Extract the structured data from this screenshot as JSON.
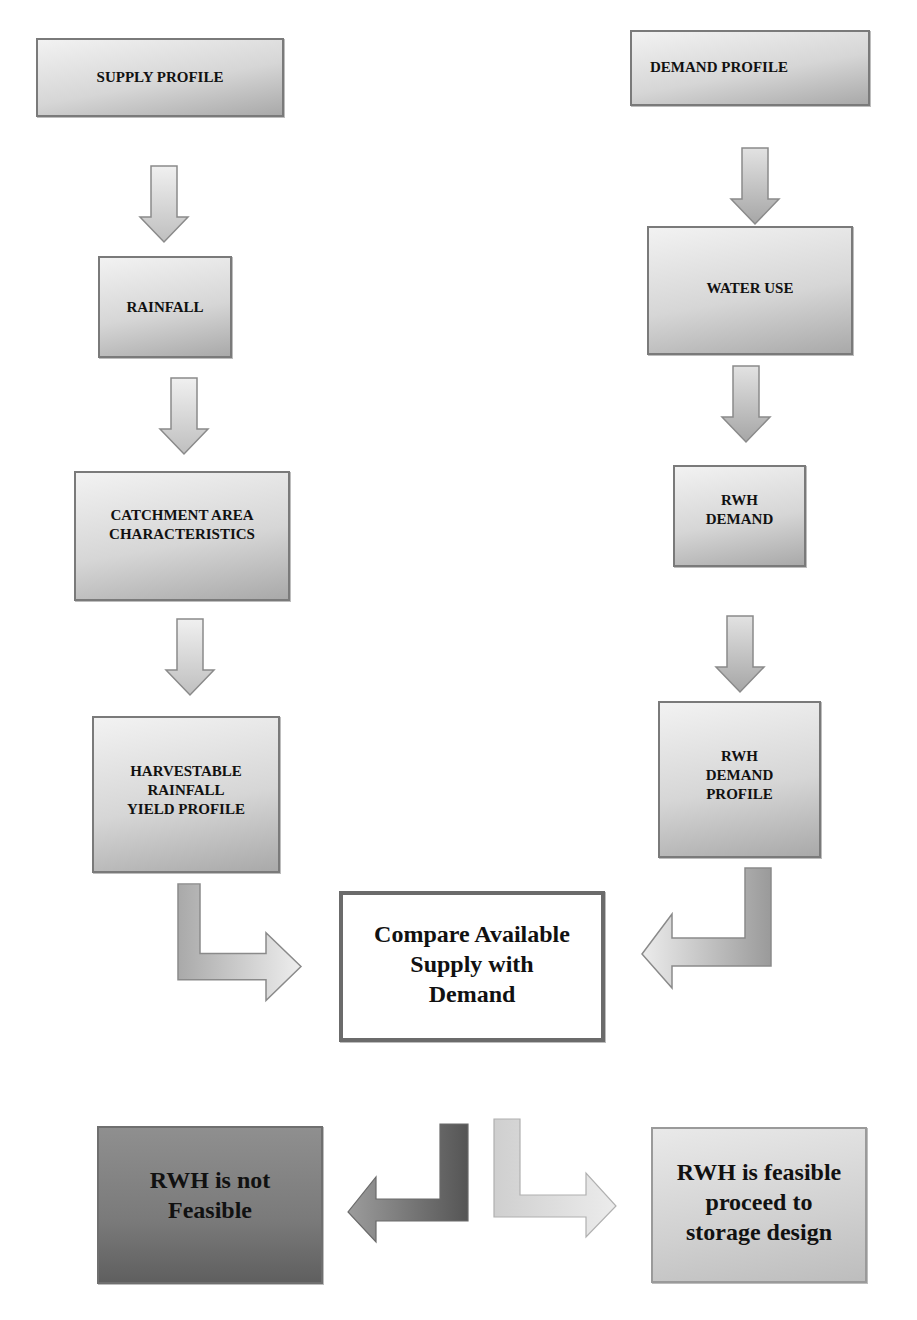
{
  "diagram": {
    "type": "flowchart",
    "left_column": {
      "supply_profile": "SUPPLY PROFILE",
      "rainfall": "RAINFALL",
      "catchment": "CATCHMENT AREA\nCHARACTERISTICS",
      "harvestable": "HARVESTABLE\nRAINFALL\nYIELD PROFILE"
    },
    "right_column": {
      "demand_profile": "DEMAND PROFILE",
      "water_use": "WATER USE",
      "rwh_demand": "RWH\nDEMAND",
      "rwh_demand_profile": "RWH\nDEMAND\nPROFILE"
    },
    "compare": "Compare Available\nSupply with\nDemand",
    "outcomes": {
      "not_feasible": "RWH is not\nFeasible",
      "feasible": "RWH is feasible\nproceed to\nstorage design"
    },
    "colors": {
      "box_light": "#f2f2f2",
      "box_dark": "#a9a9a9",
      "border": "#7a7a7a",
      "not_feasible_fill": "#7a7a7a",
      "feasible_fill": "#d0d0d0",
      "arrow_dark": "#5f5f5f"
    },
    "edges": [
      {
        "from": "SUPPLY PROFILE",
        "to": "RAINFALL"
      },
      {
        "from": "RAINFALL",
        "to": "CATCHMENT AREA CHARACTERISTICS"
      },
      {
        "from": "CATCHMENT AREA CHARACTERISTICS",
        "to": "HARVESTABLE RAINFALL YIELD PROFILE"
      },
      {
        "from": "HARVESTABLE RAINFALL YIELD PROFILE",
        "to": "Compare Available Supply with Demand"
      },
      {
        "from": "DEMAND PROFILE",
        "to": "WATER USE"
      },
      {
        "from": "WATER USE",
        "to": "RWH DEMAND"
      },
      {
        "from": "RWH DEMAND",
        "to": "RWH DEMAND PROFILE"
      },
      {
        "from": "RWH DEMAND PROFILE",
        "to": "Compare Available Supply with Demand"
      },
      {
        "from": "Compare Available Supply with Demand",
        "to": "RWH is not Feasible"
      },
      {
        "from": "Compare Available Supply with Demand",
        "to": "RWH is feasible proceed to storage design"
      }
    ]
  }
}
